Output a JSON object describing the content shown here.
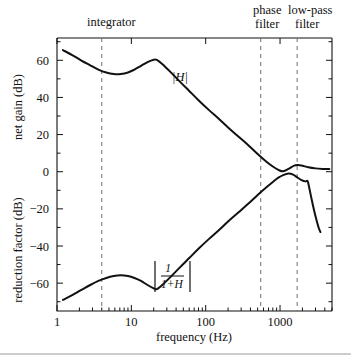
{
  "figure": {
    "background": "#ffffff",
    "ink": "#111111",
    "dash_color": "#6f6f6f"
  },
  "axes": {
    "x_title": "frequency (Hz)",
    "y_left_title_top": "net gain (dB)",
    "y_left_title_bottom": "reduction factor (dB)",
    "x_ticklabels": [
      "1",
      "10",
      "100",
      "1000"
    ],
    "y_ticklabels": [
      "60",
      "40",
      "20",
      "0",
      "−20",
      "−40",
      "−60"
    ]
  },
  "annotations": [
    {
      "name": "integrator",
      "label": "integrator"
    },
    {
      "name": "phase-filter",
      "label": "phase\nfilter",
      "line1": "phase",
      "line2": "filter"
    },
    {
      "name": "low-pass-filter",
      "label": "low-pass\nfilter",
      "line1": "low-pass",
      "line2": "filter"
    }
  ],
  "curve_labels": {
    "open_loop": "|H|",
    "reduction_num": "1",
    "reduction_den": "1+H"
  },
  "chart_data": {
    "type": "line",
    "title": "",
    "xlabel": "frequency (Hz)",
    "ylabel": "net gain (dB) / reduction factor (dB)",
    "xscale": "log",
    "xlim": [
      1,
      5000
    ],
    "ylim": [
      -75,
      72
    ],
    "xticks": [
      1,
      10,
      100,
      1000
    ],
    "yticks": [
      -60,
      -40,
      -20,
      0,
      20,
      40,
      60
    ],
    "yticks_minor": [
      -70,
      -50,
      -30,
      -10,
      10,
      30,
      50,
      70
    ],
    "grid": false,
    "legend": "inline-curve-labels",
    "vertical_markers": [
      {
        "label": "integrator",
        "x_hz": 4.0
      },
      {
        "label": "phase filter",
        "x_hz": 550
      },
      {
        "label": "low-pass filter",
        "x_hz": 1700
      }
    ],
    "series": [
      {
        "name": "|H|",
        "label": "|H|",
        "points_xy": [
          [
            1.2,
            65.5
          ],
          [
            1.6,
            62.8
          ],
          [
            2.1,
            60.0
          ],
          [
            2.8,
            57.3
          ],
          [
            3.6,
            55.0
          ],
          [
            4.6,
            53.4
          ],
          [
            5.8,
            52.6
          ],
          [
            7.2,
            52.6
          ],
          [
            9.0,
            53.4
          ],
          [
            11.0,
            55.0
          ],
          [
            13.5,
            57.0
          ],
          [
            16.5,
            59.0
          ],
          [
            20.0,
            60.3
          ],
          [
            22.0,
            60.2
          ],
          [
            26.0,
            58.0
          ],
          [
            34.0,
            53.5
          ],
          [
            45.0,
            48.5
          ],
          [
            60.0,
            43.5
          ],
          [
            80.0,
            38.5
          ],
          [
            110.0,
            33.3
          ],
          [
            150.0,
            28.5
          ],
          [
            200.0,
            23.8
          ],
          [
            280.0,
            18.7
          ],
          [
            380.0,
            14.0
          ],
          [
            500.0,
            9.5
          ],
          [
            650.0,
            5.5
          ],
          [
            800.0,
            2.8
          ],
          [
            950.0,
            1.0
          ],
          [
            1100.0,
            0.2
          ],
          [
            1300.0,
            1.5
          ],
          [
            1550.0,
            3.3
          ],
          [
            1750.0,
            3.6
          ],
          [
            2000.0,
            3.2
          ],
          [
            2400.0,
            2.4
          ],
          [
            3000.0,
            1.8
          ],
          [
            3800.0,
            1.5
          ],
          [
            4600.0,
            1.4
          ]
        ]
      },
      {
        "name": "|1/(1+H)|",
        "label": "|1/(1+H)|",
        "points_xy": [
          [
            1.2,
            -69.0
          ],
          [
            1.6,
            -66.5
          ],
          [
            2.1,
            -63.8
          ],
          [
            2.8,
            -61.0
          ],
          [
            3.6,
            -58.8
          ],
          [
            4.6,
            -57.2
          ],
          [
            5.8,
            -56.2
          ],
          [
            7.2,
            -55.8
          ],
          [
            9.0,
            -56.2
          ],
          [
            11.0,
            -57.2
          ],
          [
            13.5,
            -58.8
          ],
          [
            16.5,
            -61.0
          ],
          [
            20.0,
            -62.8
          ],
          [
            22.0,
            -63.2
          ],
          [
            26.0,
            -61.0
          ],
          [
            34.0,
            -56.5
          ],
          [
            45.0,
            -51.5
          ],
          [
            60.0,
            -46.5
          ],
          [
            80.0,
            -41.5
          ],
          [
            110.0,
            -36.3
          ],
          [
            150.0,
            -31.5
          ],
          [
            200.0,
            -26.8
          ],
          [
            280.0,
            -21.7
          ],
          [
            380.0,
            -17.0
          ],
          [
            500.0,
            -12.5
          ],
          [
            650.0,
            -8.5
          ],
          [
            800.0,
            -5.5
          ],
          [
            950.0,
            -3.2
          ],
          [
            1100.0,
            -1.8
          ],
          [
            1300.0,
            -1.0
          ],
          [
            1500.0,
            -1.6
          ],
          [
            1700.0,
            -3.0
          ],
          [
            1950.0,
            -4.5
          ],
          [
            2200.0,
            -5.2
          ],
          [
            2350.0,
            -5.0
          ],
          [
            2450.0,
            -8.0
          ],
          [
            2700.0,
            -16.0
          ],
          [
            3000.0,
            -24.0
          ],
          [
            3300.0,
            -30.0
          ],
          [
            3500.0,
            -32.5
          ]
        ]
      }
    ]
  }
}
